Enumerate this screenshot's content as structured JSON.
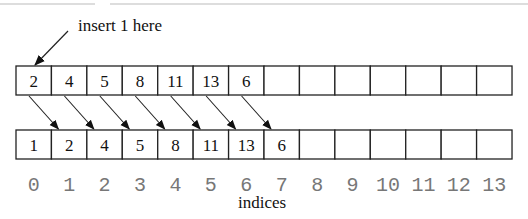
{
  "annotation": {
    "text": "insert 1 here"
  },
  "top_array": {
    "values": [
      "2",
      "4",
      "5",
      "8",
      "11",
      "13",
      "6",
      "",
      "",
      "",
      "",
      "",
      "",
      ""
    ]
  },
  "bottom_array": {
    "values": [
      "1",
      "2",
      "4",
      "5",
      "8",
      "11",
      "13",
      "6",
      "",
      "",
      "",
      "",
      "",
      ""
    ]
  },
  "indices": {
    "values": [
      "0",
      "1",
      "2",
      "3",
      "4",
      "5",
      "6",
      "7",
      "8",
      "9",
      "10",
      "11",
      "12",
      "13"
    ],
    "label": "indices"
  },
  "shift_arrows": {
    "from_top_cells": [
      0,
      1,
      2,
      3,
      4,
      5,
      6
    ],
    "to_bottom_cells": [
      1,
      2,
      3,
      4,
      5,
      6,
      7
    ]
  },
  "colors": {
    "line": "#222222",
    "index_text": "#777777",
    "top_rule": "#bbbbbb"
  }
}
